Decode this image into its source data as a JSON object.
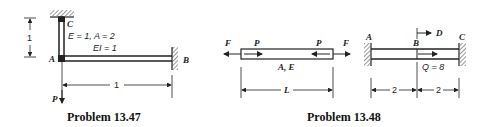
{
  "problem_1347": {
    "caption": "Problem 13.47",
    "node_labels": {
      "A": "A",
      "B": "B",
      "C": "C"
    },
    "member_ac_props": "E = 1, A = 2",
    "member_ab_props": "EI = 1",
    "vertical_dim": "1",
    "horizontal_dim": "1",
    "load_label": "P"
  },
  "problem_1348a": {
    "force_left": "F",
    "force_right": "F",
    "internal_left": "P",
    "internal_right": "P",
    "bar_props": "A, E",
    "length_dim": "L"
  },
  "problem_1348b": {
    "caption": "Problem 13.48",
    "node_labels": {
      "A": "A",
      "B": "B",
      "C": "C"
    },
    "displacement_label": "D",
    "load_label": "Q = 8",
    "dim_left": "2",
    "dim_right": "2"
  }
}
